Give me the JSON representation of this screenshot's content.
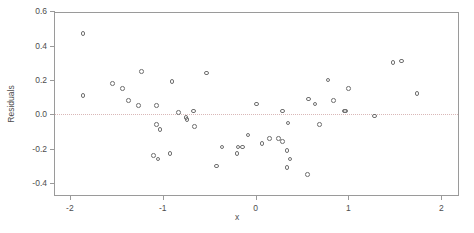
{
  "chart_data": {
    "type": "scatter",
    "title": "",
    "xlabel": "x",
    "ylabel": "Residuals",
    "xlim": [
      -2.16,
      2.18
    ],
    "ylim": [
      -0.47,
      0.59
    ],
    "grid": false,
    "legend": null,
    "reference_lines": [
      {
        "axis": "y",
        "value": 0.0,
        "style": "dotted",
        "color": "#d9b7b7"
      }
    ],
    "xticks": [
      -2,
      -1,
      0,
      1,
      2
    ],
    "xtick_labels": [
      "-2",
      "-1",
      "0",
      "1",
      "2"
    ],
    "yticks": [
      -0.4,
      -0.2,
      0.0,
      0.2,
      0.4,
      0.6
    ],
    "ytick_labels": [
      "-0.4",
      "-0.2",
      "0.0",
      "0.2",
      "0.4",
      "0.6"
    ],
    "marker": {
      "shape": "circle-open",
      "color": "#6f6f6f",
      "size": 4.6
    },
    "n_points": 48,
    "x": [
      -1.86,
      -1.86,
      -1.54,
      -1.43,
      -1.37,
      -1.26,
      -1.23,
      -1.1,
      -1.07,
      -1.07,
      -1.05,
      -1.03,
      -0.92,
      -0.9,
      -0.83,
      -0.75,
      -0.74,
      -0.67,
      -0.66,
      -0.53,
      -0.42,
      -0.36,
      -0.2,
      -0.19,
      -0.14,
      -0.08,
      0.01,
      0.07,
      0.15,
      0.25,
      0.29,
      0.29,
      0.34,
      0.34,
      0.35,
      0.37,
      0.56,
      0.57,
      0.64,
      0.69,
      0.78,
      0.84,
      0.96,
      0.97,
      1.0,
      1.28,
      1.48,
      1.57,
      1.74
    ],
    "y": [
      0.47,
      0.11,
      0.18,
      0.15,
      0.08,
      0.05,
      0.25,
      -0.24,
      0.05,
      -0.06,
      -0.26,
      -0.09,
      -0.23,
      0.19,
      0.01,
      -0.02,
      -0.03,
      0.02,
      -0.07,
      0.24,
      -0.3,
      -0.19,
      -0.23,
      -0.19,
      -0.19,
      -0.12,
      0.06,
      -0.17,
      -0.14,
      -0.14,
      0.02,
      -0.16,
      -0.21,
      -0.31,
      -0.05,
      -0.26,
      -0.35,
      0.09,
      0.06,
      -0.06,
      0.2,
      0.08,
      0.02,
      0.02,
      0.15,
      -0.01,
      0.3,
      0.31,
      0.12
    ]
  }
}
